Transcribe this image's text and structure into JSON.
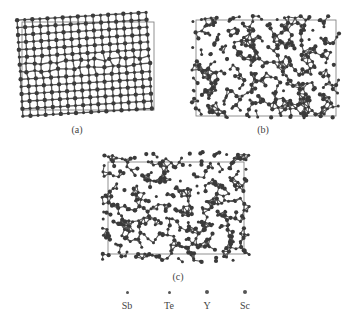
{
  "figure": {
    "panels": [
      {
        "id": "a",
        "caption": "(a)",
        "structure": "ordered-lattice-with-defect-band"
      },
      {
        "id": "b",
        "caption": "(b)",
        "structure": "disordered-amorphous"
      },
      {
        "id": "c",
        "caption": "(c)",
        "structure": "disordered-amorphous"
      }
    ],
    "legend": [
      {
        "label": "Sb",
        "size": "small"
      },
      {
        "label": "Te",
        "size": "small"
      },
      {
        "label": "Y",
        "size": "medium"
      },
      {
        "label": "Sc",
        "size": "medium"
      }
    ],
    "colors": {
      "atom": "#3a3a3a",
      "bond": "#555555",
      "cell_box": "#777777"
    }
  }
}
